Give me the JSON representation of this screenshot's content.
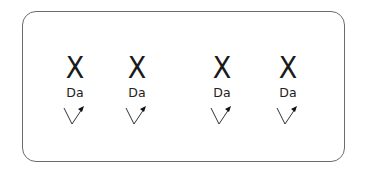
{
  "diagram": {
    "items": [
      {
        "symbol": "X",
        "label": "Da",
        "icon": "check-arrow-icon"
      },
      {
        "symbol": "X",
        "label": "Da",
        "icon": "check-arrow-icon"
      },
      {
        "symbol": "X",
        "label": "Da",
        "icon": "check-arrow-icon"
      },
      {
        "symbol": "X",
        "label": "Da",
        "icon": "check-arrow-icon"
      }
    ],
    "colors": {
      "border": "#6b6b6b",
      "text": "#1a1a1a"
    }
  }
}
